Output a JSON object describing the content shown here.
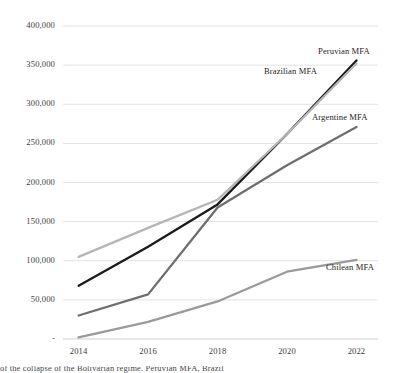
{
  "chart_data": {
    "type": "line",
    "title": "",
    "subtitle": "",
    "xlabel": "",
    "ylabel": "",
    "x": [
      2014,
      2015,
      2016,
      2017,
      2018,
      2019,
      2020,
      2021,
      2022
    ],
    "xlim": [
      2013.5,
      2022.6
    ],
    "ylim": [
      0,
      400000
    ],
    "ytick_values": [
      0,
      50000,
      100000,
      150000,
      200000,
      250000,
      300000,
      350000,
      400000
    ],
    "ytick_labels": [
      "-",
      "50,000",
      "100,000",
      "150,000",
      "200,000",
      "250,000",
      "300,000",
      "350,000",
      "400,000"
    ],
    "xtick_values": [
      2014,
      2016,
      2018,
      2020,
      2022
    ],
    "xtick_labels": [
      "2014",
      "2016",
      "2018",
      "2020",
      "2022"
    ],
    "grid": "horizontal",
    "legend_position": "inline-annotations",
    "series": [
      {
        "name": "Peruvian MFA",
        "color": "#1a1a1a",
        "label_x": 318,
        "label_y": 46,
        "x": [
          2014,
          2016,
          2018,
          2020,
          2022
        ],
        "values": [
          68000,
          118000,
          172000,
          262000,
          356000
        ]
      },
      {
        "name": "Brazilian MFA",
        "color": "#b5b5b5",
        "label_x": 264,
        "label_y": 66,
        "x": [
          2014,
          2016,
          2018,
          2020,
          2022
        ],
        "values": [
          105000,
          142000,
          178000,
          262000,
          352000
        ]
      },
      {
        "name": "Argentine MFA",
        "color": "#6e6e6e",
        "label_x": 312,
        "label_y": 112,
        "x": [
          2014,
          2016,
          2018,
          2020,
          2022
        ],
        "values": [
          30000,
          57000,
          168000,
          222000,
          271000
        ]
      },
      {
        "name": "Chilean MFA",
        "color": "#9a9a9a",
        "label_x": 326,
        "label_y": 262,
        "x": [
          2014,
          2016,
          2018,
          2020,
          2022
        ],
        "values": [
          2000,
          22000,
          48000,
          86000,
          101000
        ]
      }
    ]
  },
  "axis": {
    "ytick_labels": [
      "400,000",
      "350,000",
      "300,000",
      "250,000",
      "200,000",
      "150,000",
      "100,000",
      "50,000",
      "-"
    ],
    "xtick_labels": [
      "2014",
      "2016",
      "2018",
      "2020",
      "2022"
    ]
  },
  "labels": {
    "peruvian": "Peruvian MFA",
    "brazilian": "Brazilian MFA",
    "argentine": "Argentine MFA",
    "chilean": "Chilean MFA"
  },
  "caption": {
    "clipped_line": "of the collapse of the Bolivarian regime. Peruvian MFA, Brazil"
  },
  "colors": {
    "peruvian": "#1a1a1a",
    "brazilian": "#b5b5b5",
    "argentine": "#6e6e6e",
    "chilean": "#9a9a9a",
    "gridline": "#e2e2e2",
    "axis": "#cfcfcf",
    "text": "#3d3d3d"
  }
}
